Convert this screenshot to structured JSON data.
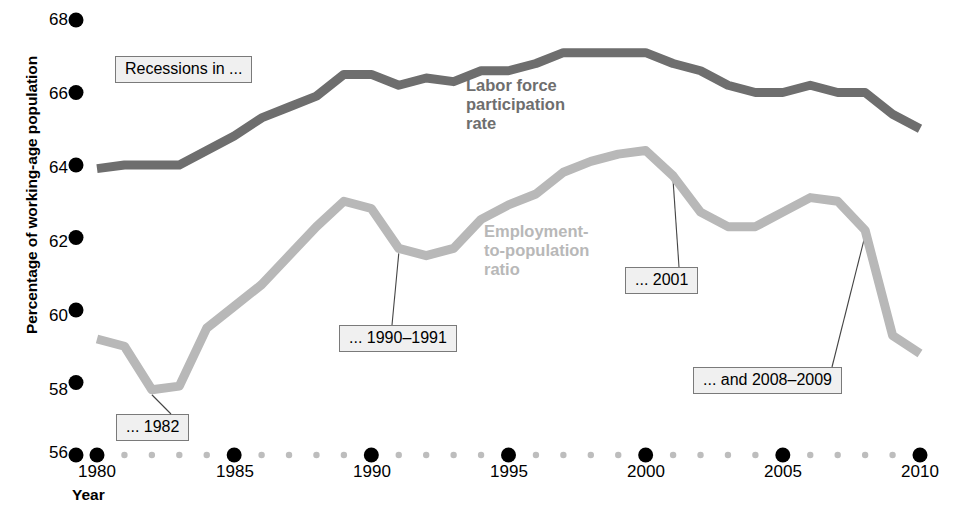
{
  "chart_data": {
    "type": "line",
    "title": "",
    "xlabel": "Year",
    "ylabel": "Percentage of working-age population",
    "xlim": [
      1980,
      2010
    ],
    "ylim": [
      56,
      68
    ],
    "xticks": [
      1980,
      1985,
      1990,
      1995,
      2000,
      2005,
      2010
    ],
    "yticks": [
      56,
      58,
      60,
      62,
      64,
      66,
      68
    ],
    "grid": false,
    "legend_position": "inline-labels",
    "x": [
      1980,
      1981,
      1982,
      1983,
      1984,
      1985,
      1986,
      1987,
      1988,
      1989,
      1990,
      1991,
      1992,
      1993,
      1994,
      1995,
      1996,
      1997,
      1998,
      1999,
      2000,
      2001,
      2002,
      2003,
      2004,
      2005,
      2006,
      2007,
      2008,
      2009,
      2010
    ],
    "series": [
      {
        "name": "Labor force participation rate",
        "color": "#6e6e6e",
        "values": [
          63.9,
          64.0,
          64.0,
          64.0,
          64.4,
          64.8,
          65.3,
          65.6,
          65.9,
          66.5,
          66.5,
          66.2,
          66.4,
          66.3,
          66.6,
          66.6,
          66.8,
          67.1,
          67.1,
          67.1,
          67.1,
          66.8,
          66.6,
          66.2,
          66.0,
          66.0,
          66.2,
          66.0,
          66.0,
          65.4,
          65.0
        ]
      },
      {
        "name": "Employment-to-population ratio",
        "color": "#b8b8b8",
        "values": [
          59.2,
          59.0,
          57.8,
          57.9,
          59.5,
          60.1,
          60.7,
          61.5,
          62.3,
          63.0,
          62.8,
          61.7,
          61.5,
          61.7,
          62.5,
          62.9,
          63.2,
          63.8,
          64.1,
          64.3,
          64.4,
          63.7,
          62.7,
          62.3,
          62.3,
          62.7,
          63.1,
          63.0,
          62.2,
          59.3,
          58.8
        ]
      }
    ],
    "annotations": [
      {
        "text": "Recessions in ...",
        "has_leader": false
      },
      {
        "text": "... 1982",
        "has_leader": true,
        "points_to_year": 1982
      },
      {
        "text": "... 1990–1991",
        "has_leader": true,
        "points_to_year": 1991
      },
      {
        "text": "... 2001",
        "has_leader": true,
        "points_to_year": 2001
      },
      {
        "text": "... and 2008–2009",
        "has_leader": true,
        "points_to_year": 2008
      }
    ]
  },
  "axes": {
    "y_title": "Percentage of working-age population",
    "x_title": "Year",
    "y_ticks": [
      "68",
      "66",
      "64",
      "62",
      "60",
      "58",
      "56"
    ],
    "x_ticks": [
      "1980",
      "1985",
      "1990",
      "1995",
      "2000",
      "2005",
      "2010"
    ]
  },
  "series_labels": {
    "labor": [
      "Labor force",
      "participation",
      "rate"
    ],
    "employment": [
      "Employment-",
      "to-population",
      "ratio"
    ]
  },
  "annotation_text": {
    "recessions": "Recessions in ...",
    "y1982": "... 1982",
    "y1990": "... 1990–1991",
    "y2001": "... 2001",
    "y2008": "... and 2008–2009"
  },
  "colors": {
    "labor_line": "#6e6e6e",
    "employment_line": "#b8b8b8",
    "axis_dot_major": "#000000",
    "axis_dot_minor": "#bdbdbd",
    "annotation_bg": "#f0f0f0",
    "annotation_border": "#7a7a7a"
  }
}
